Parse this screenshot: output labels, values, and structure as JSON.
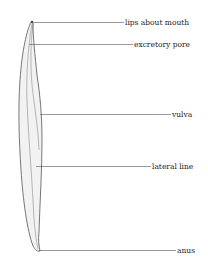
{
  "diagram": {
    "labels": [
      {
        "id": "lips",
        "text": "lips about mouth"
      },
      {
        "id": "excretory",
        "text": "excretory pore"
      },
      {
        "id": "vulva",
        "text": "vulva"
      },
      {
        "id": "lateral",
        "text": "lateral line"
      },
      {
        "id": "anus",
        "text": "anus"
      }
    ]
  }
}
